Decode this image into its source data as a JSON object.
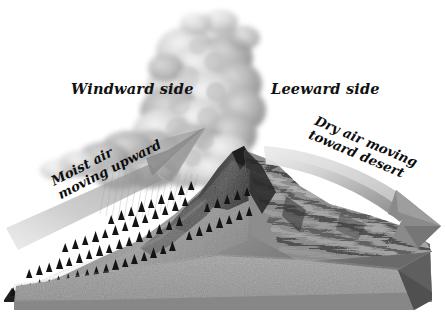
{
  "diagram": {
    "background_color": "#ffffff",
    "labels": {
      "windward": "Windward side",
      "leeward": "Leeward side",
      "moist_line1": "Moist air",
      "moist_line2": "moving upward",
      "dry_line1": "Dry air moving",
      "dry_line2": "toward desert"
    },
    "colors": {
      "background": "#ffffff",
      "text": "#111111",
      "cloud_light": "#e8e8e8",
      "cloud_mid": "#b9b9b9",
      "cloud_dark": "#8f8f8f",
      "arrow_left": "#8c8c8c",
      "arrow_right_light": "#dedede",
      "arrow_right_dark": "#7a7a7a",
      "mountain_rock": "#8a8a8a",
      "mountain_shadow": "#3a3a3a",
      "forest": "#1a1a1a",
      "ground": "#9a9a9a",
      "ground_side": "#6e6e6e"
    },
    "elements": {
      "cloud": "cumulonimbus-cloud",
      "rain": "precipitation-hatching",
      "left_arrow": "moist-air-updraft-arrow",
      "right_arrow": "dry-air-downdraft-arrow",
      "mountain": "mountain-range",
      "forest": "conifer-forest",
      "leeward_slope": "barren-rocky-slope",
      "base": "ground-base-block"
    }
  }
}
